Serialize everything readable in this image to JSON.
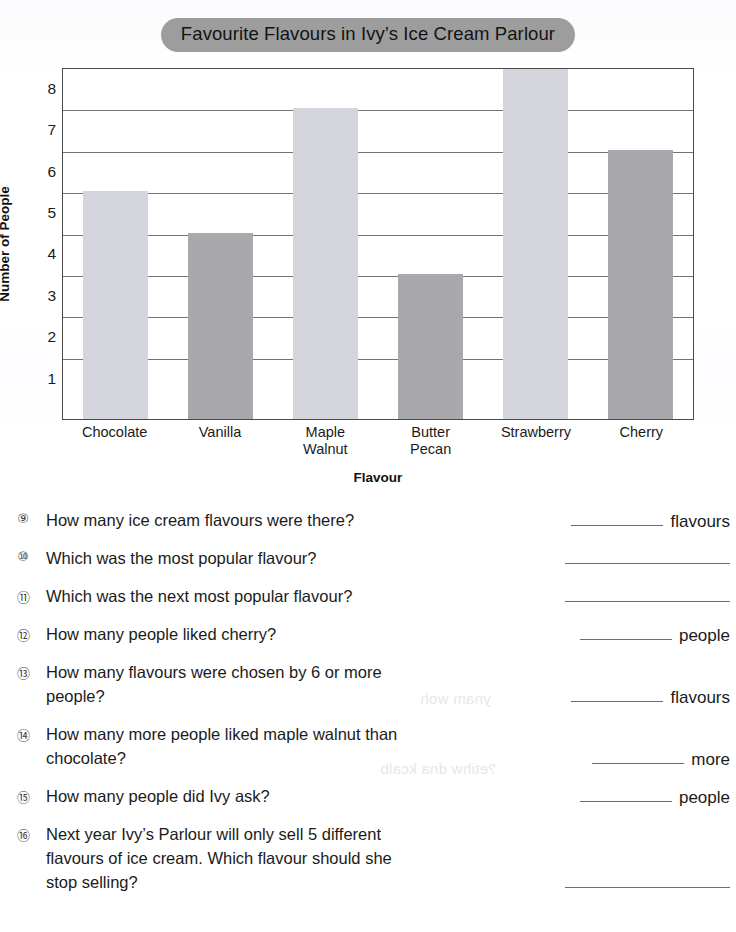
{
  "chart_data": {
    "type": "bar",
    "title": "Favourite Flavours in Ivy’s Ice Cream Parlour",
    "xlabel": "Flavour",
    "ylabel": "Number of People",
    "categories": [
      "Chocolate",
      "Vanilla",
      "Maple Walnut",
      "Butter Pecan",
      "Strawberry",
      "Cherry"
    ],
    "category_lines": [
      [
        "Chocolate"
      ],
      [
        "Vanilla"
      ],
      [
        "Maple",
        "Walnut"
      ],
      [
        "Butter",
        "Pecan"
      ],
      [
        "Strawberry"
      ],
      [
        "Cherry"
      ]
    ],
    "values": [
      5.5,
      4.5,
      7.5,
      3.5,
      8.5,
      6.5
    ],
    "ytick_labels": [
      "1",
      "2",
      "3",
      "4",
      "5",
      "6",
      "7",
      "8"
    ],
    "ylim": [
      0,
      8.5
    ],
    "gridlines_at": [
      1.5,
      2.5,
      3.5,
      4.5,
      5.5,
      6.5,
      7.5
    ],
    "grid": true,
    "legend": "none",
    "bar_colors": [
      "#d4d4dc",
      "#a9a9ad",
      "#d4d4dc",
      "#a9a9ad",
      "#d4d4dc",
      "#a9a9ad"
    ],
    "title_pill_color": "#9d9d9d"
  },
  "questions": [
    {
      "number": "⑨",
      "text": "How many ice cream flavours were there?",
      "lines": [
        "How many ice cream flavours were there?"
      ],
      "answer_unit": "flavours",
      "rule_width": 92
    },
    {
      "number": "⑩",
      "text": "Which was the most popular flavour?",
      "lines": [
        "Which was the most popular flavour?"
      ],
      "answer_unit": "",
      "rule_width": 165
    },
    {
      "number": "⑪",
      "text": "Which was the next most popular flavour?",
      "lines": [
        "Which was the next most popular flavour?"
      ],
      "answer_unit": "",
      "rule_width": 165
    },
    {
      "number": "⑫",
      "text": "How many people liked cherry?",
      "lines": [
        "How many people liked cherry?"
      ],
      "answer_unit": "people",
      "rule_width": 92
    },
    {
      "number": "⑬",
      "text": "How many flavours were chosen by 6 or more people?",
      "lines": [
        "How many flavours were chosen by 6 or more",
        "people?"
      ],
      "answer_unit": "flavours",
      "rule_width": 92
    },
    {
      "number": "⑭",
      "text": "How many more people liked maple walnut than chocolate?",
      "lines": [
        "How many more people liked maple walnut than",
        "chocolate?"
      ],
      "answer_unit": "more",
      "rule_width": 92
    },
    {
      "number": "⑮",
      "text": "How many people did Ivy ask?",
      "lines": [
        "How many people did Ivy ask?"
      ],
      "answer_unit": "people",
      "rule_width": 92
    },
    {
      "number": "⑯",
      "text": "Next year Ivy’s Parlour will only sell 5 different flavours of ice cream.  Which flavour should she stop selling?",
      "lines": [
        "Next year Ivy’s Parlour will only sell 5 different",
        "flavours of ice cream.  Which flavour should she",
        "stop selling?"
      ],
      "answer_unit": "",
      "rule_width": 165
    }
  ]
}
